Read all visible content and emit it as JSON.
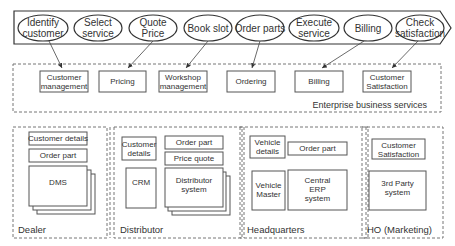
{
  "process_steps": [
    {
      "label": [
        "Identify",
        "customer"
      ]
    },
    {
      "label": [
        "Select",
        "service"
      ]
    },
    {
      "label": [
        "Quote",
        "Price"
      ]
    },
    {
      "label": [
        "Book slot"
      ]
    },
    {
      "label": [
        "Order parts"
      ]
    },
    {
      "label": [
        "Execute",
        "service"
      ]
    },
    {
      "label": [
        "Billing"
      ]
    },
    {
      "label": [
        "Check",
        "satisfaction"
      ]
    }
  ],
  "enterprise_services": {
    "title": "Enterprise business services",
    "services": [
      {
        "label": [
          "Customer",
          "management"
        ]
      },
      {
        "label": [
          "Pricing"
        ]
      },
      {
        "label": [
          "Workshop",
          "management"
        ]
      },
      {
        "label": [
          "Ordering"
        ]
      },
      {
        "label": [
          "Billing"
        ]
      },
      {
        "label": [
          "Customer",
          "Satisfaction"
        ]
      }
    ]
  },
  "domains": [
    {
      "title": "Dealer",
      "boxes": [
        [
          "Customer details"
        ],
        [
          "Order part"
        ]
      ],
      "system": [
        "DMS"
      ]
    },
    {
      "title": "Distributor",
      "boxes": [
        [
          "Customer",
          "details"
        ],
        [
          "Order part"
        ],
        [
          "Price quote"
        ]
      ],
      "systems": [
        [
          "CRM"
        ],
        [
          "Distributor",
          "system"
        ]
      ]
    },
    {
      "title": "Headquarters",
      "boxes": [
        [
          "Vehicle",
          "details"
        ],
        [
          "Order part"
        ]
      ],
      "systems": [
        [
          "Vehicle",
          "Master"
        ],
        [
          "Central",
          "ERP",
          "system"
        ]
      ]
    },
    {
      "title": "HO (Marketing)",
      "boxes": [
        [
          "Customer",
          "Satisfaction"
        ]
      ],
      "systems": [
        [
          "3rd Party",
          "system"
        ]
      ]
    }
  ],
  "colors": {
    "stroke": "#555555",
    "text": "#333333",
    "dash": "#777777"
  }
}
